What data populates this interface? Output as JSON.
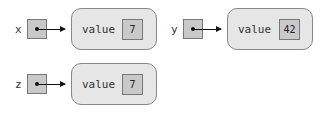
{
  "diagram": {
    "type": "reference-diagram",
    "variables": [
      {
        "name": "x",
        "points_to": 0
      },
      {
        "name": "y",
        "points_to": 1
      },
      {
        "name": "z",
        "points_to": 2
      }
    ],
    "objects": [
      {
        "field": "value",
        "value": "7"
      },
      {
        "field": "value",
        "value": "42"
      },
      {
        "field": "value",
        "value": "7"
      }
    ],
    "colors": {
      "background": "#ffffff",
      "reference_box": "#c9c9c9",
      "object_fill": "#e6e6e6",
      "border": "#777777",
      "arrow": "#111111"
    }
  }
}
